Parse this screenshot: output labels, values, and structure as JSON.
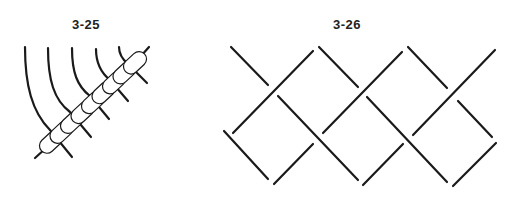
{
  "figures": [
    {
      "id": "3-25",
      "label": "3-25",
      "description": "Five curved strands bound by a diagonal chain of nine beads (clove hitch / bead binding)",
      "bead_count": 9,
      "strand_count": 5
    },
    {
      "id": "3-26",
      "label": "3-26",
      "description": "Interwoven diagonal strands forming a braided lattice pattern",
      "segment_count": 13
    }
  ],
  "colors": {
    "stroke": "#1a1a1a",
    "bead_fill": "#ffffff",
    "background": "#ffffff",
    "label": "#222222"
  }
}
